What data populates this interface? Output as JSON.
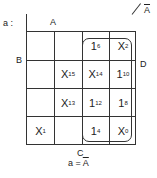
{
  "labels": {
    "map_name": "a :",
    "A": "A",
    "B": "B",
    "C": "C",
    "D": "D",
    "A_bar": "A",
    "caption": "a = A"
  },
  "cells": [
    [
      {
        "v": "",
        "s": ""
      },
      {
        "v": "",
        "s": ""
      },
      {
        "v": "1",
        "s": "6"
      },
      {
        "v": "X",
        "s": "2"
      }
    ],
    [
      {
        "v": "",
        "s": ""
      },
      {
        "v": "X",
        "s": "15"
      },
      {
        "v": "X",
        "s": "14"
      },
      {
        "v": "1",
        "s": "10"
      }
    ],
    [
      {
        "v": "",
        "s": ""
      },
      {
        "v": "X",
        "s": "13"
      },
      {
        "v": "1",
        "s": "12"
      },
      {
        "v": "1",
        "s": "8"
      }
    ],
    [
      {
        "v": "X",
        "s": "1"
      },
      {
        "v": "",
        "s": ""
      },
      {
        "v": "1",
        "s": "4"
      },
      {
        "v": "X",
        "s": "0"
      }
    ]
  ]
}
